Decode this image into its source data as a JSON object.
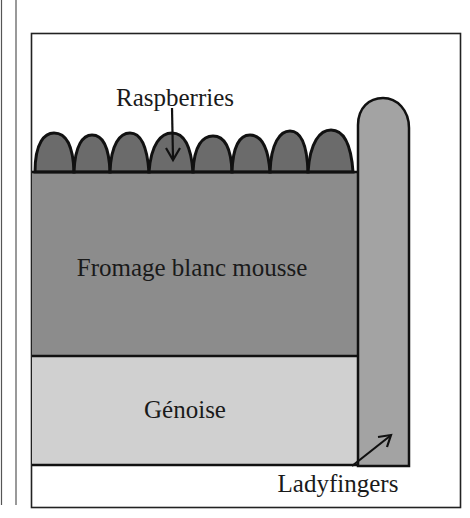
{
  "diagram": {
    "type": "cross-section",
    "layers": [
      {
        "id": "raspberries",
        "label": "Raspberries",
        "color": "#6b6b6b",
        "count": 8
      },
      {
        "id": "mousse",
        "label": "Fromage blanc mousse",
        "color": "#8c8c8c"
      },
      {
        "id": "genoise",
        "label": "Génoise",
        "color": "#d0d0d0"
      },
      {
        "id": "ladyfingers",
        "label": "Ladyfingers",
        "color": "#a3a3a3"
      }
    ],
    "labels": {
      "raspberries": "Raspberries",
      "mousse": "Fromage blanc mousse",
      "genoise": "Génoise",
      "ladyfingers": "Ladyfingers"
    },
    "colors": {
      "outline": "#111111",
      "frame": "#222222",
      "background": "#ffffff"
    }
  }
}
